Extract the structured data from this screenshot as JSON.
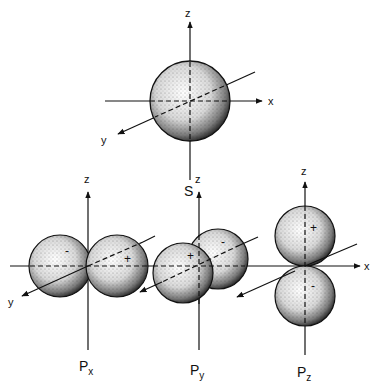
{
  "figure": {
    "axis_labels": {
      "x": "x",
      "y": "y",
      "z": "z"
    },
    "orbitals": [
      {
        "id": "s",
        "label": "S",
        "sub": "",
        "lobes": [
          {
            "sign": ""
          }
        ]
      },
      {
        "id": "px",
        "label": "P",
        "sub": "x",
        "lobes": [
          {
            "sign": "-"
          },
          {
            "sign": "+"
          }
        ]
      },
      {
        "id": "py",
        "label": "P",
        "sub": "y",
        "lobes": [
          {
            "sign": "+"
          },
          {
            "sign": "-"
          }
        ]
      },
      {
        "id": "pz",
        "label": "P",
        "sub": "z",
        "lobes": [
          {
            "sign": "+"
          },
          {
            "sign": "-"
          }
        ]
      }
    ],
    "colors": {
      "ink": "#111111",
      "background": "#ffffff"
    }
  }
}
